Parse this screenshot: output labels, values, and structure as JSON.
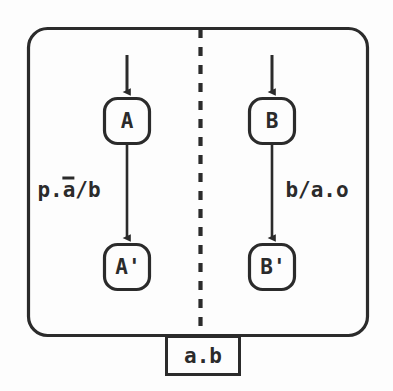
{
  "diagram": {
    "stroke_color": "#2b2b2b",
    "background_color": "#fdfdfd",
    "outer_box": {
      "name": "outer-rounded-container"
    },
    "divider": {
      "style": "dashed-vertical"
    },
    "nodes": [
      {
        "id": "A",
        "label": "A",
        "region": "left"
      },
      {
        "id": "Ap",
        "label": "A'",
        "region": "left"
      },
      {
        "id": "B",
        "label": "B",
        "region": "right"
      },
      {
        "id": "Bp",
        "label": "B'",
        "region": "right"
      }
    ],
    "edge_labels": {
      "left": {
        "pre": "p.",
        "over": "a",
        "post": "/b",
        "full": "p.ā/b"
      },
      "right": {
        "full": "b/a.o"
      }
    },
    "port_box": {
      "label": "a.b"
    }
  }
}
